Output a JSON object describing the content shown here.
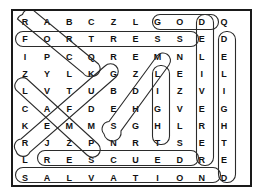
{
  "puzzle": {
    "title": "Word Search Puzzle",
    "rows": 10,
    "cols": 10,
    "grid": [
      [
        "R",
        "A",
        "B",
        "C",
        "Z",
        "L",
        "G",
        "O",
        "D",
        "Q"
      ],
      [
        "F",
        "O",
        "R",
        "T",
        "R",
        "E",
        "S",
        "S",
        "E",
        "D"
      ],
      [
        "I",
        "P",
        "C",
        "Q",
        "R",
        "E",
        "M",
        "N",
        "L",
        "E"
      ],
      [
        "Z",
        "Y",
        "L",
        "K",
        "G",
        "Z",
        "L",
        "E",
        "I",
        "L"
      ],
      [
        "L",
        "V",
        "T",
        "U",
        "B",
        "D",
        "I",
        "Z",
        "V",
        "I"
      ],
      [
        "C",
        "A",
        "F",
        "D",
        "E",
        "H",
        "G",
        "V",
        "E",
        "G"
      ],
      [
        "K",
        "E",
        "M",
        "M",
        "S",
        "G",
        "H",
        "L",
        "R",
        "H"
      ],
      [
        "R",
        "J",
        "Z",
        "P",
        "N",
        "R",
        "T",
        "S",
        "E",
        "T"
      ],
      [
        "L",
        "R",
        "E",
        "S",
        "C",
        "U",
        "E",
        "D",
        "R",
        "E"
      ],
      [
        "S",
        "A",
        "L",
        "V",
        "A",
        "T",
        "I",
        "O",
        "N",
        "D"
      ]
    ],
    "found_words": [
      {
        "word": "ROCK",
        "direction": "diagonal-down-right",
        "start": [
          0,
          0
        ],
        "end": [
          3,
          3
        ]
      },
      {
        "word": "GOD",
        "direction": "horizontal",
        "start": [
          0,
          6
        ],
        "end": [
          0,
          8
        ]
      },
      {
        "word": "FORTRESS",
        "direction": "horizontal",
        "start": [
          1,
          0
        ],
        "end": [
          1,
          7
        ]
      },
      {
        "word": "DELIVERER",
        "direction": "vertical",
        "start": [
          0,
          8
        ],
        "end": [
          8,
          8
        ]
      },
      {
        "word": "DELIGHTED",
        "direction": "vertical",
        "start": [
          1,
          9
        ],
        "end": [
          9,
          9
        ]
      },
      {
        "word": "LIGHT",
        "direction": "vertical",
        "start": [
          3,
          6
        ],
        "end": [
          7,
          6
        ]
      },
      {
        "word": "STRENGTH",
        "direction": "diagonal-up-right",
        "start": [
          6,
          4
        ],
        "end": [
          2,
          5
        ]
      },
      {
        "word": "LAMP",
        "direction": "diagonal-down-right",
        "start": [
          4,
          0
        ],
        "end": [
          7,
          3
        ]
      },
      {
        "word": "REFUGE",
        "direction": "diagonal-up-right",
        "start": [
          7,
          0
        ],
        "end": [
          3,
          4
        ]
      },
      {
        "word": "RESCUED",
        "direction": "horizontal",
        "start": [
          8,
          1
        ],
        "end": [
          8,
          7
        ]
      },
      {
        "word": "SALVATION",
        "direction": "horizontal",
        "start": [
          9,
          0
        ],
        "end": [
          9,
          8
        ]
      }
    ],
    "colors": {
      "border": "#1a1a1a",
      "letter": "#111111",
      "highlight": "#2b2b2b",
      "background": "#ffffff"
    }
  }
}
